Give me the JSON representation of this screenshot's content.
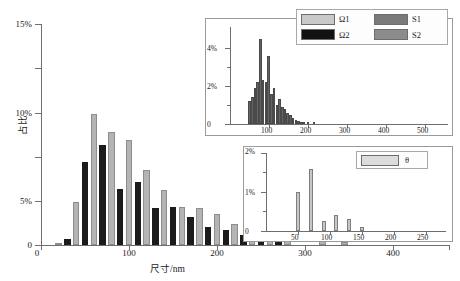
{
  "chart_data": [
    {
      "id": "main",
      "type": "bar",
      "title": "",
      "xlabel": "尺寸/nm",
      "ylabel": "占比",
      "xlim": [
        0,
        460
      ],
      "ylim": [
        0,
        15
      ],
      "xticks": [
        0,
        100,
        200,
        300,
        400
      ],
      "xtick_labels": [
        "0",
        "100",
        "200",
        "300",
        "400"
      ],
      "yticks": [
        0,
        5,
        10,
        15
      ],
      "ytick_labels": [
        "0",
        "5%",
        "10%",
        "15%"
      ],
      "grid": false,
      "legend_position": "top-right",
      "series": [
        {
          "name": "Ω1",
          "color": "#b4b4b4",
          "x": [
            20,
            40,
            60,
            80,
            100,
            120,
            140,
            160,
            180,
            200,
            220,
            240,
            260,
            280,
            320,
            345
          ],
          "values": [
            0.15,
            2.9,
            8.9,
            7.7,
            7.1,
            5.1,
            3.7,
            2.6,
            2.5,
            2.1,
            1.4,
            1.5,
            0.7,
            0.55,
            0.25,
            0.2
          ]
        },
        {
          "name": "Ω2",
          "color": "#1b1b1b",
          "x": [
            30,
            50,
            70,
            90,
            110,
            130,
            150,
            170,
            190,
            210,
            230,
            250,
            270
          ],
          "values": [
            0.4,
            5.6,
            6.8,
            3.8,
            4.3,
            2.5,
            2.6,
            1.9,
            1.2,
            1.0,
            0.65,
            0.2,
            0.5
          ]
        }
      ]
    },
    {
      "id": "inset-top",
      "type": "bar",
      "title": "",
      "xlim": [
        0,
        560
      ],
      "ylim": [
        0,
        5
      ],
      "xticks": [
        100,
        200,
        300,
        400,
        500
      ],
      "xtick_labels": [
        "100",
        "200",
        "300",
        "400",
        "500"
      ],
      "yticks": [
        0,
        2,
        4
      ],
      "ytick_labels": [
        "0",
        "2%",
        "4%"
      ],
      "grid": false,
      "series": [
        {
          "name": "S1/S2",
          "color": "#636363",
          "x": [
            50,
            57,
            64,
            71,
            78,
            85,
            92,
            99,
            106,
            113,
            120,
            127,
            134,
            141,
            148,
            155,
            162,
            169,
            176,
            183,
            190,
            200,
            215
          ],
          "values": [
            1.2,
            1.4,
            1.9,
            2.2,
            4.5,
            2.3,
            2.2,
            3.6,
            1.6,
            1.9,
            1.0,
            1.3,
            0.9,
            0.8,
            0.6,
            0.45,
            0.3,
            0.2,
            0.15,
            0.1,
            0.08,
            0.08,
            0.1
          ]
        }
      ]
    },
    {
      "id": "inset-bottom",
      "type": "bar",
      "title": "",
      "xlim": [
        0,
        275
      ],
      "ylim": [
        0,
        2
      ],
      "xticks": [
        50,
        100,
        150,
        200,
        250
      ],
      "xtick_labels": [
        "50",
        "100",
        "150",
        "200",
        "250"
      ],
      "yticks": [
        0,
        1,
        2
      ],
      "ytick_labels": [
        "0",
        "1%",
        "2%"
      ],
      "grid": false,
      "legend_position": "top-right",
      "series": [
        {
          "name": "θ",
          "color": "#c6c6c6",
          "x": [
            50,
            70,
            90,
            110,
            130,
            150
          ],
          "values": [
            1.0,
            1.6,
            0.25,
            0.4,
            0.3,
            0.1
          ]
        }
      ]
    }
  ],
  "main": {
    "ylabel": "占比",
    "xlabel": "尺寸/nm",
    "ytick_labels": [
      "0",
      "5%",
      "10%",
      "15%"
    ],
    "xtick_labels": [
      "0",
      "100",
      "200",
      "300",
      "400"
    ]
  },
  "inset_top": {
    "ytick_labels": [
      "0",
      "2%",
      "4%"
    ],
    "xtick_labels": [
      "100",
      "200",
      "300",
      "400",
      "500"
    ]
  },
  "inset_bottom": {
    "ytick_labels": [
      "0",
      "1%",
      "2%"
    ],
    "xtick_labels": [
      "50",
      "100",
      "150",
      "200",
      "250"
    ]
  },
  "legend_main": {
    "items": [
      {
        "label": "Ω1",
        "color": "#c9c9c9"
      },
      {
        "label": "S1",
        "color": "#7a7a7a"
      },
      {
        "label": "Ω2",
        "color": "#121212"
      },
      {
        "label": "S2",
        "color": "#8c8c8c"
      }
    ]
  },
  "legend_inset": {
    "items": [
      {
        "label": "θ",
        "color": "#dcdcdc"
      }
    ]
  }
}
